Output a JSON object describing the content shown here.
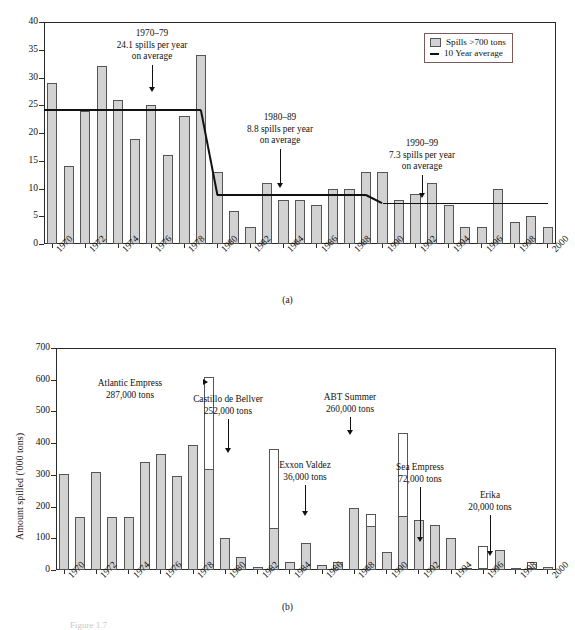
{
  "figure": {
    "caption_fragment": "Figure 1.7",
    "panel_a_caption": "(a)",
    "panel_b_caption": "(b)"
  },
  "chart_data": [
    {
      "id": "panel-a",
      "type": "bar",
      "title": "",
      "xlabel": "",
      "ylabel": "",
      "ylim": [
        0,
        40
      ],
      "yticks": [
        0,
        5,
        10,
        15,
        20,
        25,
        30,
        35,
        40
      ],
      "xticks": [
        "1970",
        "1972",
        "1974",
        "1976",
        "1978",
        "1980",
        "1982",
        "1984",
        "1986",
        "1988",
        "1990",
        "1992",
        "1994",
        "1996",
        "1998",
        "2000"
      ],
      "grid": false,
      "legend_position": "top-right",
      "legend": [
        {
          "label": "Spills >700 tons",
          "marker": "filled-box",
          "color": "#d2d2d2"
        },
        {
          "label": "10 Year average",
          "marker": "line",
          "color": "#111111"
        }
      ],
      "categories": [
        1970,
        1971,
        1972,
        1973,
        1974,
        1975,
        1976,
        1977,
        1978,
        1979,
        1980,
        1981,
        1982,
        1983,
        1984,
        1985,
        1986,
        1987,
        1988,
        1989,
        1990,
        1991,
        1992,
        1993,
        1994,
        1995,
        1996,
        1997,
        1998,
        1999,
        2000
      ],
      "series": [
        {
          "name": "Spills >700 tons",
          "values": [
            29,
            14,
            24,
            32,
            26,
            19,
            25,
            16,
            23,
            34,
            13,
            6,
            3,
            11,
            8,
            8,
            7,
            10,
            10,
            13,
            13,
            8,
            9,
            11,
            7,
            3,
            3,
            10,
            4,
            5,
            3
          ]
        }
      ],
      "average_line": {
        "name": "10 Year average",
        "segments": [
          {
            "from_year": 1970,
            "to_year": 1979,
            "value": 24.1
          },
          {
            "from_year": 1980,
            "to_year": 1989,
            "value": 8.8
          },
          {
            "from_year": 1990,
            "to_year": 2000,
            "value": 7.3
          }
        ]
      },
      "annotations": [
        {
          "lines": [
            "1970–79",
            "24.1 spills per year",
            "on average"
          ],
          "points_to_year": 1975
        },
        {
          "lines": [
            "1980–89",
            "8.8 spills per year",
            "on average"
          ],
          "points_to_year": 1985
        },
        {
          "lines": [
            "1990–99",
            "7.3 spills per year",
            "on average"
          ],
          "points_to_year": 1995
        }
      ]
    },
    {
      "id": "panel-b",
      "type": "bar",
      "title": "",
      "xlabel": "",
      "ylabel": "Amount spilled ('000 tons)",
      "ylim": [
        0,
        700
      ],
      "yticks": [
        0,
        100,
        200,
        300,
        400,
        500,
        600,
        700
      ],
      "xticks": [
        "1970",
        "1972",
        "1974",
        "1976",
        "1978",
        "1980",
        "1982",
        "1984",
        "1986",
        "1988",
        "1990",
        "1992",
        "1994",
        "1996",
        "1998",
        "2000"
      ],
      "grid": false,
      "legend_position": "none",
      "categories": [
        1970,
        1971,
        1972,
        1973,
        1974,
        1975,
        1976,
        1977,
        1978,
        1979,
        1980,
        1981,
        1982,
        1983,
        1984,
        1985,
        1986,
        1987,
        1988,
        1989,
        1990,
        1991,
        1992,
        1993,
        1994,
        1995,
        1996,
        1997,
        1998,
        1999,
        2000
      ],
      "series": [
        {
          "name": "Total amount spilled",
          "values": [
            302,
            167,
            310,
            166,
            168,
            342,
            367,
            296,
            394,
            608,
            101,
            41,
            10,
            383,
            24,
            85,
            15,
            26,
            197,
            176,
            58,
            432,
            159,
            141,
            101,
            5,
            77,
            62,
            5,
            25,
            8
          ]
        },
        {
          "name": "Excluding named major spill",
          "values": [
            302,
            167,
            310,
            166,
            168,
            342,
            367,
            296,
            394,
            318,
            101,
            41,
            10,
            131,
            24,
            85,
            15,
            26,
            197,
            140,
            58,
            171,
            159,
            141,
            101,
            5,
            4,
            62,
            5,
            5,
            8
          ]
        }
      ],
      "annotations": [
        {
          "lines": [
            "Atlantic Empress",
            "287,000 tons"
          ],
          "points_to_year": 1979,
          "arrow": "right"
        },
        {
          "lines": [
            "Castillo de Bellver",
            "252,000 tons"
          ],
          "points_to_year": 1983,
          "arrow": "down"
        },
        {
          "lines": [
            "ABT Summer",
            "260,000 tons"
          ],
          "points_to_year": 1991,
          "arrow": "down"
        },
        {
          "lines": [
            "Exxon Valdez",
            "36,000 tons"
          ],
          "points_to_year": 1989,
          "arrow": "down"
        },
        {
          "lines": [
            "Sea Empress",
            "72,000 tons"
          ],
          "points_to_year": 1996,
          "arrow": "down"
        },
        {
          "lines": [
            "Erika",
            "20,000 tons"
          ],
          "points_to_year": 1999,
          "arrow": "down"
        }
      ]
    }
  ]
}
